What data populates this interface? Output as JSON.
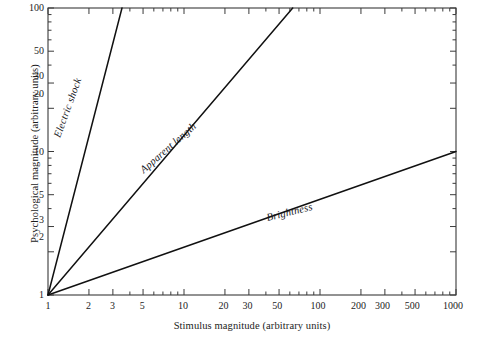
{
  "chart_data": {
    "type": "line",
    "title": "",
    "xlabel": "Stimulus magnitude (arbitrary units)",
    "ylabel": "Psychological magnitude (arbitrary units)",
    "xscale": "log",
    "yscale": "log",
    "xlim": [
      1,
      1000
    ],
    "ylim": [
      1,
      100
    ],
    "grid": false,
    "legend": "inline-curve-labels",
    "xticks": [
      1,
      2,
      3,
      5,
      10,
      20,
      30,
      50,
      100,
      200,
      300,
      500,
      1000
    ],
    "xtick_labels": [
      "1",
      "2",
      "3",
      "5",
      "10",
      "20",
      "30",
      "50",
      "100",
      "200",
      "300",
      "500",
      "1000"
    ],
    "yticks": [
      1,
      2,
      3,
      5,
      10,
      20,
      30,
      50,
      100
    ],
    "ytick_labels": [
      "1",
      "2",
      "3",
      "5",
      "10",
      "20",
      "30",
      "50",
      "100"
    ],
    "x_minor_ticks": [
      4,
      6,
      7,
      8,
      9,
      40,
      60,
      70,
      80,
      90,
      400,
      600,
      700,
      800,
      900
    ],
    "y_minor_ticks": [
      4,
      6,
      7,
      8,
      9,
      40,
      60,
      70,
      80,
      90
    ],
    "series": [
      {
        "name": "Electric shock",
        "exponent": 3.65,
        "color": "#111111",
        "points": [
          [
            1,
            1
          ],
          [
            3.5,
            100
          ]
        ],
        "label_angle_deg": -70
      },
      {
        "name": "Apparent length",
        "exponent": 1.11,
        "color": "#111111",
        "points": [
          [
            1,
            1
          ],
          [
            63,
            100
          ]
        ],
        "label_angle_deg": -40
      },
      {
        "name": "Brightness",
        "exponent": 0.33,
        "color": "#111111",
        "points": [
          [
            1,
            1
          ],
          [
            1000,
            10
          ]
        ],
        "label_angle_deg": -14
      }
    ]
  },
  "axes": {
    "x_title": "Stimulus magnitude (arbitrary units)",
    "y_title": "Psychological magnitude (arbitrary units)"
  },
  "curve_labels": {
    "electric_shock": "Electric shock",
    "apparent_length": "Apparent length",
    "brightness": "Brightness"
  },
  "colors": {
    "line": "#111111",
    "frame": "#3a3a3a",
    "background": "#ffffff",
    "text": "#1c1c1c"
  }
}
